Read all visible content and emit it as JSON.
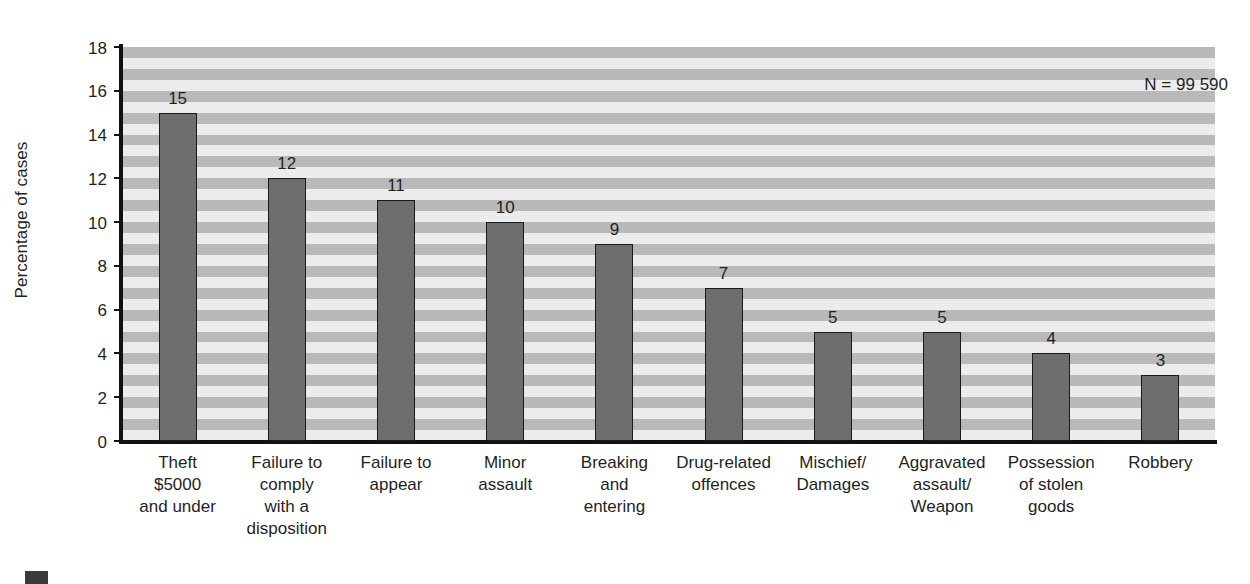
{
  "chart_data": {
    "type": "bar",
    "title": "",
    "subtitle": "",
    "xlabel": "",
    "ylabel": "Percentage of cases",
    "ylim": [
      0,
      18
    ],
    "ytick_step": 2,
    "yticks": [
      0,
      2,
      4,
      6,
      8,
      10,
      12,
      14,
      16,
      18
    ],
    "grid": false,
    "banded_background": true,
    "legend_position": "none",
    "categories": [
      "Theft $5000 and under",
      "Failure to comply with a disposition",
      "Failure to appear",
      "Minor assault",
      "Breaking and entering",
      "Drug-related offences",
      "Mischief/ Damages",
      "Aggravated assault/ Weapon",
      "Possession of stolen goods",
      "Robbery"
    ],
    "category_lines": [
      [
        "Theft",
        "$5000",
        "and under"
      ],
      [
        "Failure to",
        "comply",
        "with a",
        "disposition"
      ],
      [
        "Failure to",
        "appear"
      ],
      [
        "Minor",
        "assault"
      ],
      [
        "Breaking",
        "and",
        "entering"
      ],
      [
        "Drug-related",
        "offences"
      ],
      [
        "Mischief/",
        "Damages"
      ],
      [
        "Aggravated",
        "assault/",
        "Weapon"
      ],
      [
        "Possession",
        "of stolen",
        "goods"
      ],
      [
        "Robbery"
      ]
    ],
    "values": [
      15,
      12,
      11,
      10,
      9,
      7,
      5,
      5,
      4,
      3
    ],
    "value_labels": [
      "15",
      "12",
      "11",
      "10",
      "9",
      "7",
      "5",
      "5",
      "4",
      "3"
    ],
    "annotations": [
      {
        "name": "sample-size",
        "text": "N = 99 590",
        "position": "top-right"
      }
    ],
    "colors": {
      "bar_fill": "#6e6e6e",
      "bar_border": "#1a1a1a",
      "band_light": "#ececec",
      "band_dark": "#b9b9b9",
      "axis": "#111111",
      "text": "#1f1f1f",
      "background": "#ffffff"
    }
  }
}
